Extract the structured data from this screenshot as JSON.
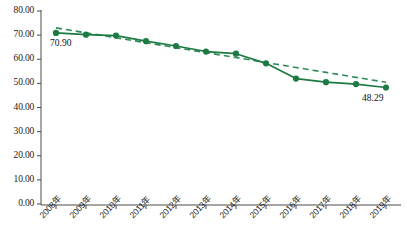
{
  "chart_data": {
    "type": "line",
    "title": "",
    "xlabel": "",
    "ylabel": "",
    "categories": [
      "2008年",
      "2009年",
      "2010年",
      "2011年",
      "2012年",
      "2013年",
      "2014年",
      "2015年",
      "2016年",
      "2017年",
      "2018年",
      "2019年"
    ],
    "series": [
      {
        "name": "主系列",
        "style": "solid",
        "marker": "circle",
        "color": "#1e7a43",
        "values": [
          70.9,
          70.2,
          69.8,
          67.5,
          65.5,
          63.2,
          62.3,
          58.3,
          52.0,
          50.5,
          49.7,
          48.29
        ]
      },
      {
        "name": "趋势线",
        "style": "dashed",
        "marker": "none",
        "color": "#1e7a43",
        "values": [
          73.0,
          70.95,
          68.9,
          66.85,
          64.8,
          62.75,
          60.7,
          58.65,
          56.6,
          54.55,
          52.5,
          50.45
        ]
      }
    ],
    "ylim": [
      0,
      80
    ],
    "ytick_step": 10,
    "ytick_labels": [
      "80.00",
      "70.00",
      "60.00",
      "50.00",
      "40.00",
      "30.00",
      "20.00",
      "10.00",
      "0.00"
    ],
    "ytick_values": [
      80,
      70,
      60,
      50,
      40,
      30,
      20,
      10,
      0
    ],
    "grid": false,
    "legend": "none",
    "annotations": [
      {
        "text": "70.90",
        "series": 0,
        "index": 0,
        "position": "below"
      },
      {
        "text": "48.29",
        "series": 0,
        "index": 11,
        "position": "below"
      }
    ]
  },
  "colors": {
    "line": "#1e7a43",
    "marker": "#1e7a43",
    "trend": "#2e8b57",
    "axis": "#4a4a4a",
    "text": "#1a1a1a",
    "background": "#ffffff"
  }
}
